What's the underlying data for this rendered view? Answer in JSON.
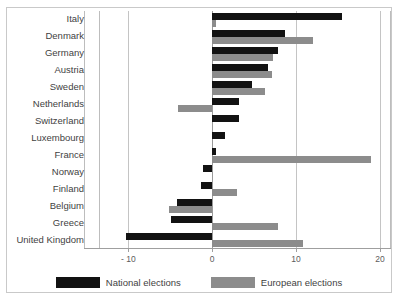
{
  "chart_data": {
    "type": "bar",
    "orientation": "horizontal",
    "title": "",
    "subtitle": "",
    "xlabel": "",
    "ylabel": "",
    "xlim": [
      -13.5,
      21.2
    ],
    "grid": true,
    "gridlines": [
      -10,
      0,
      10,
      20
    ],
    "zero_line": 0,
    "xticks": [
      -10,
      0,
      10,
      20
    ],
    "xticklabels": [
      "- 10",
      "0",
      "10",
      "20"
    ],
    "legend_position": "bottom",
    "categories": [
      "Italy",
      "Denmark",
      "Germany",
      "Austria",
      "Sweden",
      "Netherlands",
      "Switzerland",
      "Luxembourg",
      "France",
      "Norway",
      "Finland",
      "Belgium",
      "Greece",
      "United Kingdom"
    ],
    "series": [
      {
        "name": "National elections",
        "color": "#121212",
        "values": [
          15.5,
          8.7,
          7.9,
          6.7,
          4.8,
          3.2,
          3.2,
          1.5,
          0.4,
          -1.1,
          -1.3,
          -4.2,
          -4.9,
          -10.3
        ]
      },
      {
        "name": "European elections",
        "color": "#8c8c8c",
        "values": [
          0.5,
          12.0,
          7.3,
          7.1,
          6.3,
          -4.1,
          0.0,
          0.0,
          18.9,
          0.0,
          3.0,
          -5.2,
          7.8,
          10.8
        ]
      }
    ]
  },
  "legend": {
    "items": [
      {
        "label": "National elections",
        "color": "#121212"
      },
      {
        "label": "European elections",
        "color": "#8c8c8c"
      }
    ]
  }
}
